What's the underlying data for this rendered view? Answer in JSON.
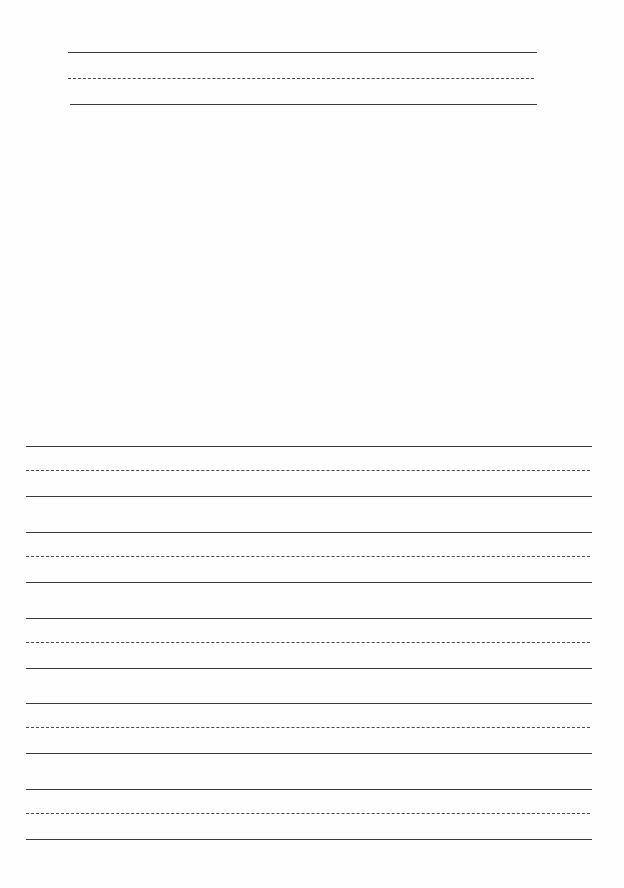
{
  "document": {
    "type": "handwriting-practice-sheet",
    "title_line": {
      "text": "",
      "left": 68,
      "width": 469,
      "top": 52,
      "spacing": [
        0,
        26,
        52
      ]
    },
    "blank_area": {
      "top": 110,
      "bottom": 430
    },
    "practice_rows": [
      {
        "top": 446
      },
      {
        "top": 532
      },
      {
        "top": 618
      },
      {
        "top": 703
      },
      {
        "top": 789
      }
    ],
    "row_left": 26,
    "row_width": 566,
    "row_spacing": [
      0,
      24,
      50
    ],
    "line_color": "#3a3a3a"
  }
}
